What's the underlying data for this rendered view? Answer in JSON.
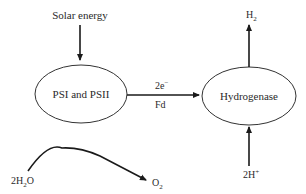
{
  "diagram": {
    "nodes": {
      "psi_psii": {
        "label": "PSI and PSII"
      },
      "hydrogenase": {
        "label": "Hydrogenase"
      }
    },
    "inputs": {
      "solar_energy": "Solar energy",
      "protons": {
        "main": "2H",
        "sup": "+"
      },
      "water": {
        "pre": "2H",
        "sub": "2",
        "post": "O"
      }
    },
    "outputs": {
      "hydrogen": {
        "main": "H",
        "sub": "2"
      },
      "oxygen": {
        "main": "O",
        "sub": "2"
      }
    },
    "edge_labels": {
      "electrons": {
        "main": "2e",
        "sup": "−"
      },
      "carrier": "Fd"
    },
    "colors": {
      "stroke": "#1a1a1a",
      "text": "#2a2a2a",
      "background": "#ffffff"
    }
  }
}
